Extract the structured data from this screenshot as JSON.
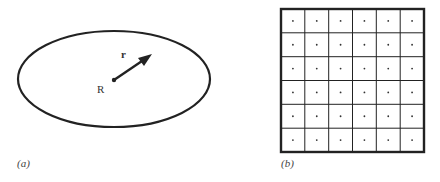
{
  "panel_a": {
    "caption": "(a)",
    "center_label": "R",
    "vector_label": "r",
    "shape": "ellipse"
  },
  "panel_b": {
    "caption": "(b)",
    "shape": "grid",
    "rows": 6,
    "cols": 6,
    "cell_marker": "dot"
  },
  "colors": {
    "stroke": "#222222",
    "background": "#ffffff"
  }
}
